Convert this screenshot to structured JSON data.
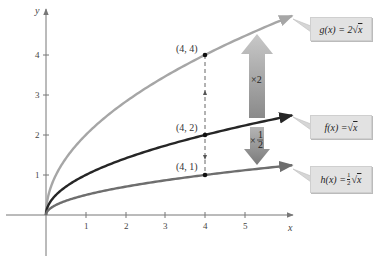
{
  "chart_data": {
    "type": "line",
    "title": "",
    "xlabel": "x",
    "ylabel": "y",
    "xlim": [
      -1,
      6.3
    ],
    "ylim": [
      -1,
      5
    ],
    "grid": false,
    "x_ticks": [
      "1",
      "2",
      "3",
      "4",
      "5"
    ],
    "y_ticks": [
      "1",
      "2",
      "3",
      "4"
    ],
    "series": [
      {
        "name": "g(x) = 2√x",
        "color": "#a6a6a6",
        "formula": "2*sqrt(x)",
        "x": [
          0,
          1,
          2,
          3,
          4,
          5,
          6.2
        ],
        "values": [
          0,
          2,
          2.83,
          3.46,
          4,
          4.47,
          4.98
        ]
      },
      {
        "name": "f(x) = √x",
        "color": "#262626",
        "formula": "sqrt(x)",
        "x": [
          0,
          1,
          2,
          3,
          4,
          5,
          6.2
        ],
        "values": [
          0,
          1,
          1.41,
          1.73,
          2,
          2.24,
          2.49
        ]
      },
      {
        "name": "h(x) = ½√x",
        "color": "#6e6e6e",
        "formula": "0.5*sqrt(x)",
        "x": [
          0,
          1,
          2,
          3,
          4,
          5,
          6.2
        ],
        "values": [
          0,
          0.5,
          0.71,
          0.87,
          1,
          1.12,
          1.24
        ]
      }
    ],
    "points": [
      {
        "label": "(4, 4)",
        "x": 4,
        "y": 4
      },
      {
        "label": "(4, 2)",
        "x": 4,
        "y": 2
      },
      {
        "label": "(4, 1)",
        "x": 4,
        "y": 1
      }
    ],
    "annotations": [
      {
        "text": "×2",
        "type": "up-arrow",
        "from": "f",
        "to": "g"
      },
      {
        "text": "×½",
        "type": "down-arrow",
        "from": "f",
        "to": "h"
      }
    ]
  },
  "labels": {
    "x_axis": "x",
    "y_axis": "y",
    "x_ticks": [
      "1",
      "2",
      "3",
      "4",
      "5"
    ],
    "y_ticks": [
      "1",
      "2",
      "3",
      "4"
    ],
    "points": [
      "(4, 4)",
      "(4, 2)",
      "(4, 1)"
    ],
    "times_two": "×2",
    "times_half_prefix": "×",
    "half_num": "1",
    "half_den": "2"
  },
  "legend": {
    "g": {
      "lhs": "g(x) = 2",
      "rad": "x"
    },
    "f": {
      "lhs": "f(x) = ",
      "rad": "x"
    },
    "h": {
      "lhs": "h(x) = ",
      "frac_num": "1",
      "frac_den": "2",
      "rad": "x"
    }
  }
}
